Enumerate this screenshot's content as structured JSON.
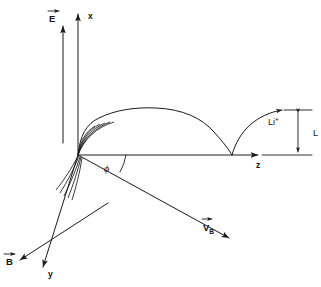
{
  "figure": {
    "background_color": "#ffffff",
    "line_color": "#1a1a1a"
  },
  "axes": {
    "x": {
      "label": "x",
      "direction": "vertical-up",
      "origin": [
        78,
        155
      ],
      "tip": [
        78,
        10
      ]
    },
    "z": {
      "label": "z",
      "direction": "horizontal-right",
      "origin": [
        78,
        155
      ],
      "tip": [
        262,
        155
      ]
    },
    "y": {
      "label": "y",
      "direction": "diagonal-down-left",
      "origin": [
        78,
        155
      ],
      "tip": [
        40,
        272
      ]
    }
  },
  "vectors": {
    "electric_field": {
      "label": "E",
      "accent": "vector-arrow",
      "description": "electric field vector, parallel to x axis",
      "tail": [
        63,
        143
      ],
      "tip": [
        63,
        22
      ]
    },
    "magnetic_field": {
      "label": "B",
      "accent": "vector-arrow",
      "description": "magnetic field vector, parallel to y axis",
      "tail": [
        108,
        203
      ],
      "tip": [
        17,
        262
      ]
    },
    "drift_velocity": {
      "label": "V",
      "subscript": "B",
      "accent": "vector-arrow",
      "description": "drift velocity vector at angle phi below the z axis",
      "tail": [
        78,
        155
      ],
      "tip": [
        233,
        240
      ]
    }
  },
  "angle": {
    "symbol": "ϕ",
    "name": "phi",
    "between": [
      "z-axis",
      "drift-velocity"
    ],
    "vertex": [
      78,
      155
    ]
  },
  "ion": {
    "label": "Li",
    "charge": "+",
    "full_label": "Li⁺",
    "description": "lithium cation following the cycloid path"
  },
  "dimension": {
    "label": "L",
    "description": "cycloid arch height measured along x",
    "top": [
      298,
      112
    ],
    "bottom": [
      298,
      155
    ]
  },
  "trajectory": {
    "type": "cycloid",
    "description": "cycloid path of the Li+ ion starting at the origin, cresting and returning to the z axis, then rising again",
    "cusp_z": 232,
    "crest_height_px": 43
  },
  "fans": {
    "upper": {
      "name": "upper-trajectory-fan",
      "count": 5,
      "description": "fan of short curved strokes leaving the origin upward"
    },
    "lower": {
      "name": "lower-trajectory-fan",
      "count": 5,
      "description": "fan of short curved strokes leaving the origin downward-left"
    }
  }
}
